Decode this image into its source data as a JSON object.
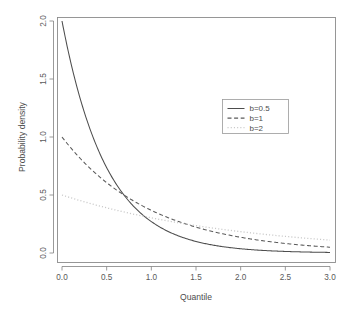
{
  "chart_data": {
    "type": "line",
    "title": "",
    "xlabel": "Quantile",
    "ylabel": "Probability density",
    "xlim": [
      0,
      3
    ],
    "ylim": [
      0,
      2
    ],
    "grid": false,
    "legend_position": "right",
    "xticks": [
      "0.0",
      "0.5",
      "1.0",
      "1.5",
      "2.0",
      "2.5",
      "3.0"
    ],
    "xtick_values": [
      0,
      0.5,
      1,
      1.5,
      2,
      2.5,
      3
    ],
    "yticks": [
      "0.0",
      "0.5",
      "1.0",
      "1.5",
      "2.0"
    ],
    "ytick_values": [
      0,
      0.5,
      1,
      1.5,
      2
    ],
    "x": [
      0,
      0.15,
      0.3,
      0.45,
      0.6,
      0.75,
      0.9,
      1.05,
      1.2,
      1.35,
      1.5,
      1.65,
      1.8,
      1.95,
      2.1,
      2.25,
      2.4,
      2.55,
      2.7,
      2.85,
      3
    ],
    "series": [
      {
        "name": "b=0.5",
        "label": "b=0.5",
        "style": "solid",
        "color": "#4d4d4d",
        "rate": 2,
        "values": [
          2.0,
          1.482,
          1.098,
          0.813,
          0.602,
          0.446,
          0.331,
          0.245,
          0.181,
          0.134,
          0.1,
          0.074,
          0.055,
          0.04,
          0.03,
          0.022,
          0.016,
          0.012,
          0.009,
          0.007,
          0.005
        ]
      },
      {
        "name": "b=1",
        "label": "b=1",
        "style": "dashed",
        "color": "#5a5a5a",
        "rate": 1,
        "values": [
          1.0,
          0.861,
          0.741,
          0.638,
          0.549,
          0.472,
          0.407,
          0.35,
          0.301,
          0.259,
          0.223,
          0.192,
          0.165,
          0.142,
          0.122,
          0.105,
          0.091,
          0.078,
          0.067,
          0.058,
          0.05
        ]
      },
      {
        "name": "b=2",
        "label": "b=2",
        "style": "dotted",
        "color": "#c9c9c9",
        "rate": 0.5,
        "values": [
          0.5,
          0.464,
          0.43,
          0.399,
          0.37,
          0.344,
          0.319,
          0.296,
          0.274,
          0.254,
          0.236,
          0.219,
          0.203,
          0.189,
          0.175,
          0.162,
          0.151,
          0.14,
          0.13,
          0.12,
          0.112
        ]
      }
    ]
  },
  "legend": {
    "entries": [
      {
        "label": "b=0.5"
      },
      {
        "label": "b=1"
      },
      {
        "label": "b=2"
      }
    ]
  },
  "colors": {
    "background": "#ffffff",
    "axis": "#808080",
    "border": "#8c8c8c",
    "text": "#4d4d4d",
    "series_solid": "#4d4d4d",
    "series_dashed": "#5a5a5a",
    "series_dotted": "#c9c9c9"
  }
}
